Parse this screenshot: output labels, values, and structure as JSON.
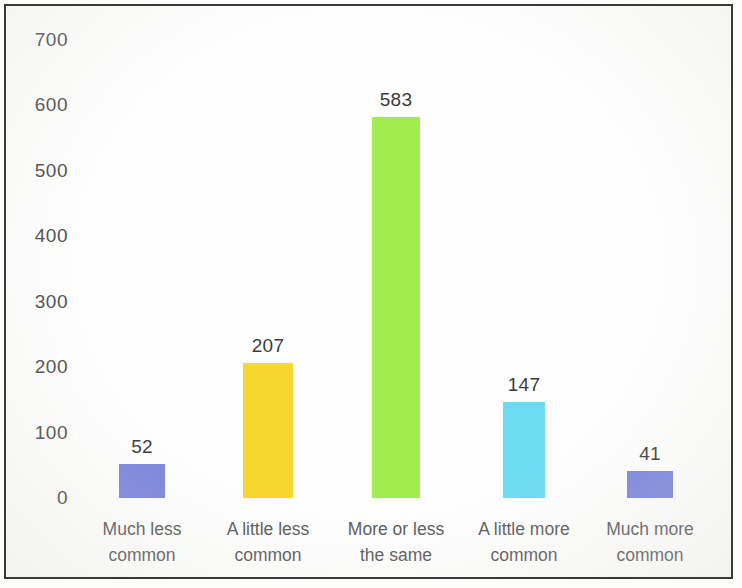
{
  "chart_data": {
    "type": "bar",
    "title": "",
    "subtitle": "",
    "xlabel": "",
    "ylabel": "",
    "categories": [
      "Much less\ncommon",
      "A little less\ncommon",
      "More or less\nthe same",
      "A little more\ncommon",
      "Much more\ncommon"
    ],
    "values": [
      52,
      207,
      583,
      147,
      41
    ],
    "value_labels": [
      "52",
      "207",
      "583",
      "147",
      "41"
    ],
    "colors": [
      "#7b86dc",
      "#f7d62e",
      "#a2ec4d",
      "#6cdcf2",
      "#7b86dc"
    ],
    "ylim": [
      0,
      700
    ],
    "yticks": [
      0,
      100,
      200,
      300,
      400,
      500,
      600,
      700
    ],
    "ytick_labels": [
      "0",
      "100",
      "200",
      "300",
      "400",
      "500",
      "600",
      "700"
    ],
    "grid": false,
    "legend": false,
    "legend_position": "none",
    "axis_line": false,
    "background_color": "#fefefe",
    "border_color": "#3a3a3a",
    "tick_label_color": "#4c4c4c",
    "value_label_color": "#3b3b3b",
    "category_label_color": "#5a5a5a"
  }
}
